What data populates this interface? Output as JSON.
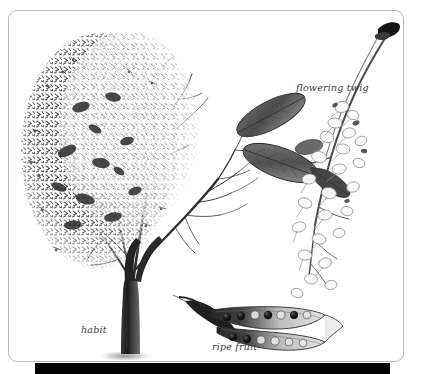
{
  "plate": {
    "kind": "botanical-illustration-plate",
    "background_color": "#ffffff",
    "frame_border_color": "#b9b9b9",
    "bottom_bar_color": "#030303",
    "ink_color": "#2b2b2b"
  },
  "labels": {
    "habit": "habit",
    "flowering_twig": "flowering twig",
    "ripe_fruit": "ripe fruit"
  },
  "figures": {
    "habit": {
      "caption": "habit",
      "description": "full tree, dense foliage on left half, bare branches on right half"
    },
    "flowering_twig": {
      "caption": "flowering twig",
      "description": "twig with dark elliptic leaves and pale flower racemes"
    },
    "ripe_fruit": {
      "caption": "ripe fruit",
      "description": "split legume pod showing dark seeds",
      "seeds_upper_valve": 7,
      "seeds_lower_valve": 6
    }
  }
}
